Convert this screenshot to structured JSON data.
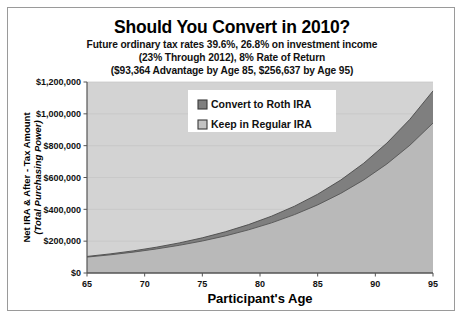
{
  "chart_data": {
    "type": "area",
    "title": "Should You Convert in 2010?",
    "subtitles": [
      "Future ordinary tax rates 39.6%, 26.8% on investment income",
      "(23% Through 2012), 8% Rate of Return",
      "($93,364 Advantage by Age 85, $256,637 by Age 95)"
    ],
    "xlabel": "Participant's Age",
    "ylabel_line1": "Net IRA & After - Tax Amount",
    "ylabel_line2": "(Total Purchasing Power)",
    "xlim": [
      65,
      95
    ],
    "ylim": [
      0,
      1200000
    ],
    "xticks": [
      65,
      70,
      75,
      80,
      85,
      90,
      95
    ],
    "xtick_labels": [
      "65",
      "70",
      "75",
      "80",
      "85",
      "90",
      "95"
    ],
    "yticks": [
      0,
      200000,
      400000,
      600000,
      800000,
      1000000,
      1200000
    ],
    "ytick_labels": [
      "$0",
      "$200,000",
      "$400,000",
      "$600,000",
      "$800,000",
      "$1,000,000",
      "$1,200,000"
    ],
    "grid": true,
    "legend_position": "top-center",
    "stacked": true,
    "x": [
      65,
      67,
      69,
      71,
      73,
      75,
      77,
      79,
      81,
      83,
      85,
      87,
      89,
      91,
      93,
      95
    ],
    "series": [
      {
        "name": "Keep in Regular IRA",
        "color": "#b9b9b9",
        "values": [
          100000,
          114000,
          131000,
          151000,
          174000,
          201000,
          233000,
          271000,
          315000,
          367000,
          428000,
          500000,
          585000,
          685000,
          803000,
          942000
        ]
      },
      {
        "name": "Convert to Roth IRA",
        "color": "#7f7f7f",
        "values": [
          104000,
          120000,
          139000,
          162000,
          189000,
          221000,
          259000,
          304000,
          357000,
          420000,
          495000,
          584000,
          690000,
          816000,
          966000,
          1144000
        ]
      }
    ]
  },
  "legend": {
    "items": [
      {
        "label": "Convert to Roth IRA",
        "color": "#7f7f7f"
      },
      {
        "label": "Keep in Regular IRA",
        "color": "#c2c2c2"
      }
    ]
  },
  "colors": {
    "plot_background": "#d3d3d3",
    "roth_band": "#7f7f7f",
    "regular_band": "#b9b9b9",
    "axis_line": "#555555",
    "grid_line": "#c4c4c4",
    "frame": "#9a9a9a"
  }
}
